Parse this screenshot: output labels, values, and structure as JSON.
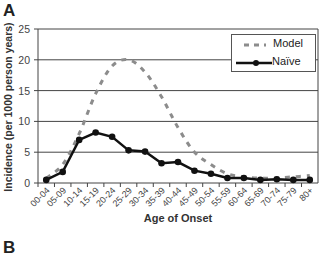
{
  "figure": {
    "panel_a_label": "A",
    "panel_b_label": "B"
  },
  "chart_data": {
    "type": "line",
    "title": "",
    "xlabel": "Age of Onset",
    "ylabel": "Incidence (per 1000 person years)",
    "ylim": [
      0,
      25
    ],
    "yticks": [
      0,
      5,
      10,
      15,
      20,
      25
    ],
    "grid": "horizontal",
    "legend_position": "upper right",
    "categories": [
      "00-04",
      "05-09",
      "10-14",
      "15-19",
      "20-24",
      "25-29",
      "30-34",
      "35-39",
      "40-44",
      "45-49",
      "50-54",
      "55-59",
      "60-64",
      "65-69",
      "70-74",
      "75-79",
      "80+"
    ],
    "series": [
      {
        "name": "Model",
        "style": "dashed",
        "color": "#8c8c8c",
        "values": [
          0.8,
          3.0,
          8.0,
          14.5,
          19.0,
          20.0,
          18.0,
          14.0,
          9.0,
          5.0,
          3.0,
          1.5,
          1.0,
          0.8,
          0.8,
          1.0,
          1.2
        ]
      },
      {
        "name": "Naïve",
        "style": "solid-with-markers",
        "color": "#111111",
        "values": [
          0.5,
          1.8,
          7.0,
          8.2,
          7.5,
          5.3,
          5.1,
          3.2,
          3.4,
          2.0,
          1.5,
          0.8,
          0.8,
          0.5,
          0.6,
          0.5,
          0.5
        ]
      }
    ]
  }
}
